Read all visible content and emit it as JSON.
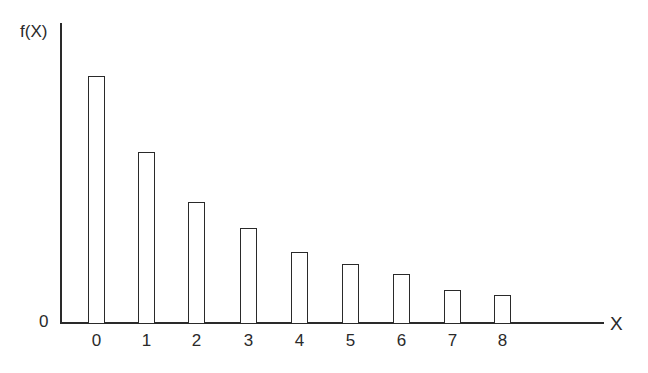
{
  "chart_data": {
    "type": "bar",
    "title": "",
    "xlabel": "X",
    "ylabel": "f(X)",
    "y_origin_label": "0",
    "categories": [
      "0",
      "1",
      "2",
      "3",
      "4",
      "5",
      "6",
      "7",
      "8"
    ],
    "values": [
      247,
      171,
      121,
      95,
      71,
      59,
      49,
      33,
      28
    ],
    "values_note": "relative heights (px above baseline); no y-axis scale shown",
    "relative_values": [
      0.82,
      0.57,
      0.4,
      0.32,
      0.24,
      0.2,
      0.16,
      0.11,
      0.09
    ],
    "grid": false,
    "legend": null,
    "bar_style": "outlined, unfilled"
  },
  "axis": {
    "y_label": "f(X)",
    "x_label": "X",
    "origin": "0"
  }
}
